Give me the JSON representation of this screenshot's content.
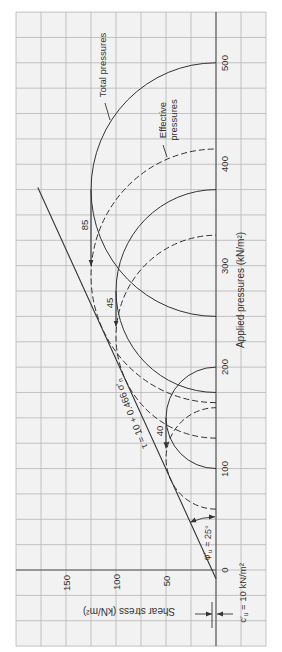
{
  "chart_data": {
    "type": "line",
    "title": "",
    "xlabel": "Applied pressures (kN/m²)",
    "ylabel": "Shear stress (kN/m²)",
    "xlim": [
      -75,
      550
    ],
    "ylim": [
      -50,
      200
    ],
    "x_ticks": [
      0,
      100,
      200,
      300,
      400,
      500
    ],
    "y_ticks": [
      50,
      100,
      150
    ],
    "grid": true,
    "grid_step": 25,
    "legend_position": "annotated on curves",
    "orientation": "figure rotated 90° counter-clockwise (normal stress axis vertical, shear stress increasing leftward)",
    "series": [
      {
        "name": "Total pressures",
        "line_style": "solid",
        "mohr_circles": [
          {
            "sigma3": 100,
            "sigma1": 200,
            "center": 150,
            "radius": 50
          },
          {
            "sigma3": 175,
            "sigma1": 375,
            "center": 275,
            "radius": 100
          },
          {
            "sigma3": 250,
            "sigma1": 500,
            "center": 375,
            "radius": 125
          }
        ]
      },
      {
        "name": "Effective pressures",
        "line_style": "dashed",
        "mohr_circles": [
          {
            "sigma3": 60,
            "sigma1": 160,
            "center": 110,
            "radius": 50
          },
          {
            "sigma3": 130,
            "sigma1": 330,
            "center": 230,
            "radius": 100
          },
          {
            "sigma3": 165,
            "sigma1": 415,
            "center": 290,
            "radius": 125
          }
        ]
      }
    ],
    "pore_pressures": [
      {
        "label": "40",
        "value": 40,
        "tau": 50,
        "from_center": 150,
        "to_center": 110
      },
      {
        "label": "45",
        "value": 45,
        "tau": 100,
        "from_center": 275,
        "to_center": 230
      },
      {
        "label": "85",
        "value": 85,
        "tau": 125,
        "from_center": 375,
        "to_center": 290
      }
    ],
    "envelope": {
      "equation": "τ = 10 + 0.466 σ′n",
      "c_prime": 10,
      "tan_phi_prime": 0.466,
      "phi_prime_deg": 25
    },
    "annotations": [
      "Total pressures",
      "Effective pressures",
      "τ = 10 + 0.466 σ′n",
      "φ′u = 25°",
      "c′u = 10 kN/m²",
      "40",
      "45",
      "85"
    ]
  },
  "labels": {
    "total": "Total pressures",
    "effective_line1": "Effective",
    "effective_line2": "pressures",
    "envelope": {
      "main": "τ = 10 + 0.466 σ′",
      "sub": "n"
    },
    "angle": {
      "sym": "φ′",
      "sub": "u",
      "rest": " = 25°"
    },
    "cohesion": {
      "sym": "c′",
      "sub": "u",
      "rest": " = 10 kN/m²"
    }
  },
  "colors": {
    "ink": "#333333",
    "grid": "#b5b5b5",
    "plot_bg": "#f2f2f2"
  }
}
